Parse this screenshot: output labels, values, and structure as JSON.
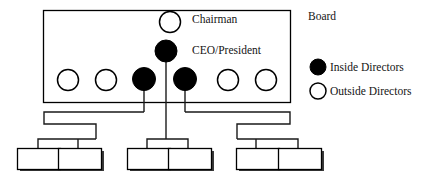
{
  "diagram": {
    "title_label": "Board",
    "roles": {
      "chairman": "Chairman",
      "ceo": "CEO/President"
    },
    "legend": [
      {
        "label": "Inside Directors",
        "marker": "filled-circle-icon",
        "color": "#000000"
      },
      {
        "label": "Outside Directors",
        "marker": "open-circle-icon",
        "color": "#FFFFFF"
      }
    ],
    "board_members": [
      {
        "type": "outside",
        "filled": false
      },
      {
        "type": "outside",
        "filled": false
      },
      {
        "type": "inside",
        "filled": true
      },
      {
        "type": "inside",
        "filled": true
      },
      {
        "type": "outside",
        "filled": false
      },
      {
        "type": "outside",
        "filled": false
      }
    ],
    "chairman_marker": {
      "type": "outside",
      "filled": false
    },
    "ceo_marker": {
      "type": "inside",
      "filled": true
    },
    "subordinate_units": [
      {
        "group": "left",
        "index": 1,
        "label": ""
      },
      {
        "group": "left",
        "index": 2,
        "label": ""
      },
      {
        "group": "center",
        "index": 1,
        "label": ""
      },
      {
        "group": "center",
        "index": 2,
        "label": ""
      },
      {
        "group": "right",
        "index": 1,
        "label": ""
      },
      {
        "group": "right",
        "index": 2,
        "label": ""
      }
    ],
    "colors": {
      "stroke": "#000000",
      "fill_inside": "#000000",
      "fill_outside": "#FFFFFF",
      "shadow": "#3a3a3a",
      "background": "#FFFFFF"
    }
  }
}
